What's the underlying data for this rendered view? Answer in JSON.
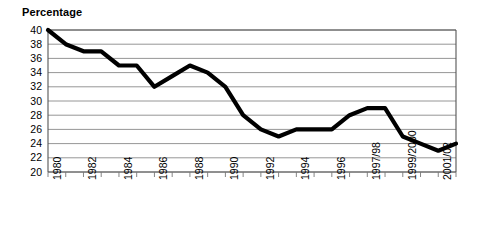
{
  "chart_data": {
    "type": "line",
    "title": "",
    "ylabel": "Percentage",
    "xlabel": "",
    "ylim": [
      20,
      40
    ],
    "yticks": [
      20,
      22,
      24,
      26,
      28,
      30,
      32,
      34,
      36,
      38,
      40
    ],
    "grid": true,
    "legend": "none",
    "line_color": "#000000",
    "categories": [
      "1980",
      "1981",
      "1982",
      "1983",
      "1984",
      "1985",
      "1986",
      "1987",
      "1988",
      "1989",
      "1990",
      "1991",
      "1992",
      "1993",
      "1994",
      "1995",
      "1996",
      "1996/97",
      "1997/98",
      "1998/99",
      "1999/2000",
      "2000/01",
      "2001/02",
      "2002/03"
    ],
    "tick_labels": [
      "1980",
      "1982",
      "1984",
      "1986",
      "1988",
      "1990",
      "1992",
      "1994",
      "1996",
      "1997/98",
      "1999/2000",
      "2001/02"
    ],
    "values": [
      40,
      38,
      37,
      37,
      35,
      35,
      32,
      33.5,
      35,
      34,
      32,
      28,
      26,
      25,
      26,
      26,
      26,
      28,
      29,
      29,
      25,
      24,
      23,
      24
    ]
  },
  "axis": {
    "y_title": "Percentage"
  }
}
